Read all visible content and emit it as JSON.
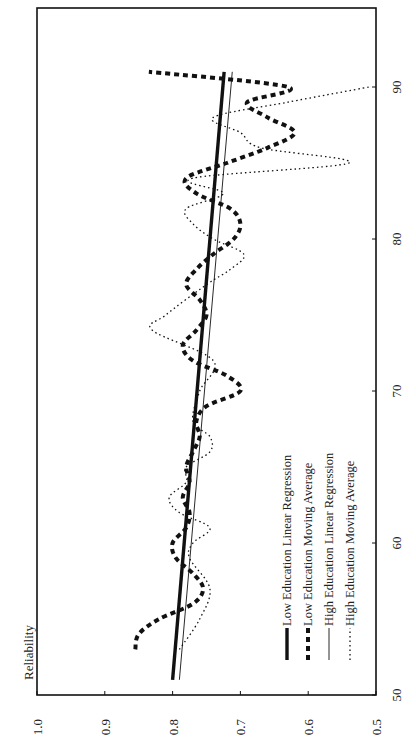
{
  "chart_data": {
    "type": "line",
    "orientation": "rotated-90-ccw",
    "title": "",
    "ylabel": "Reliability",
    "xlabel": "",
    "xlim": [
      50,
      95
    ],
    "ylim": [
      0.5,
      1.0
    ],
    "x_ticks": [
      50,
      60,
      70,
      80,
      90
    ],
    "x_tick_labels": [
      "50",
      "60",
      "70",
      "80",
      "90"
    ],
    "y_ticks": [
      1.0,
      0.9,
      0.8,
      0.7,
      0.6,
      0.5
    ],
    "y_tick_labels": [
      "1.0",
      "0.9",
      "0.8",
      "0.7",
      "0.6",
      "0.5"
    ],
    "grid": false,
    "legend_position": "lower-right (inside plot)",
    "series": [
      {
        "name": "Low Education Linear Regression",
        "style": "thick-solid",
        "x": [
          51,
          91
        ],
        "values": [
          0.8,
          0.724
        ]
      },
      {
        "name": "Low Education Moving Average",
        "style": "thick-dashed",
        "x": [
          53,
          54,
          55,
          56,
          57,
          58,
          59,
          60,
          61,
          62,
          63,
          64,
          65,
          66,
          67,
          68,
          69,
          70,
          71,
          72,
          73,
          74,
          75,
          76,
          77,
          78,
          79,
          80,
          81,
          82,
          83,
          84,
          85,
          86,
          87,
          88,
          89,
          90,
          91
        ],
        "values": [
          0.855,
          0.85,
          0.82,
          0.77,
          0.755,
          0.77,
          0.795,
          0.8,
          0.78,
          0.775,
          0.785,
          0.775,
          0.78,
          0.77,
          0.76,
          0.765,
          0.75,
          0.7,
          0.72,
          0.77,
          0.785,
          0.765,
          0.75,
          0.76,
          0.78,
          0.765,
          0.74,
          0.71,
          0.7,
          0.715,
          0.765,
          0.78,
          0.72,
          0.66,
          0.62,
          0.66,
          0.69,
          0.63,
          0.835
        ]
      },
      {
        "name": "High Education Linear Regression",
        "style": "thin-solid",
        "x": [
          51,
          91
        ],
        "values": [
          0.79,
          0.712
        ]
      },
      {
        "name": "High Education Moving Average",
        "style": "dotted",
        "x": [
          53,
          55,
          57,
          59,
          60,
          61,
          62,
          63,
          64,
          65,
          66,
          67,
          68,
          70,
          72,
          74,
          75,
          77,
          78,
          79,
          80,
          81,
          82,
          83,
          84,
          85,
          86,
          87,
          88,
          89,
          90
        ],
        "values": [
          0.79,
          0.76,
          0.745,
          0.775,
          0.77,
          0.745,
          0.79,
          0.805,
          0.78,
          0.78,
          0.745,
          0.745,
          0.77,
          0.76,
          0.74,
          0.83,
          0.81,
          0.75,
          0.715,
          0.695,
          0.74,
          0.77,
          0.78,
          0.725,
          0.77,
          0.54,
          0.67,
          0.7,
          0.74,
          0.63,
          0.51
        ]
      }
    ]
  },
  "legend": {
    "items": [
      {
        "label": "Low Education Linear Regression",
        "style": "thick-solid"
      },
      {
        "label": "Low Education Moving Average",
        "style": "thick-dashed"
      },
      {
        "label": "High Education Linear Regression",
        "style": "thin-solid"
      },
      {
        "label": "High Education Moving Average",
        "style": "dotted"
      }
    ]
  },
  "colors": {
    "ink": "#111111",
    "background": "#ffffff"
  }
}
